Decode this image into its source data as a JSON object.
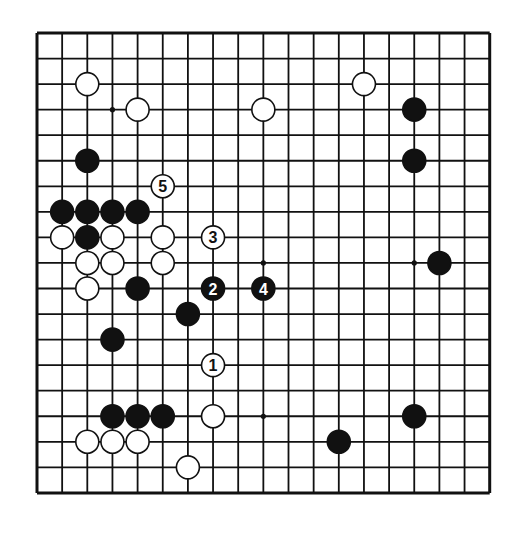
{
  "board": {
    "size": 19,
    "origin_x": 37,
    "origin_y": 33,
    "spacing_x": 25.15,
    "spacing_y": 25.55,
    "stone_radius": 11.5,
    "colors": {
      "background": "#ffffff",
      "line": "#111111",
      "black_stone": "#111111",
      "white_stone": "#ffffff",
      "stone_outline": "#111111"
    },
    "star_points": [
      [
        3,
        3
      ],
      [
        9,
        9
      ],
      [
        15,
        9
      ],
      [
        9,
        15
      ]
    ],
    "stones": [
      {
        "color": "white",
        "col": 2,
        "row": 2
      },
      {
        "color": "white",
        "col": 4,
        "row": 3
      },
      {
        "color": "white",
        "col": 9,
        "row": 3
      },
      {
        "color": "white",
        "col": 13,
        "row": 2
      },
      {
        "color": "black",
        "col": 15,
        "row": 3
      },
      {
        "color": "black",
        "col": 2,
        "row": 5
      },
      {
        "color": "black",
        "col": 15,
        "row": 5
      },
      {
        "color": "black",
        "col": 1,
        "row": 7
      },
      {
        "color": "black",
        "col": 2,
        "row": 7
      },
      {
        "color": "black",
        "col": 3,
        "row": 7
      },
      {
        "color": "black",
        "col": 4,
        "row": 7
      },
      {
        "color": "white",
        "col": 1,
        "row": 8
      },
      {
        "color": "black",
        "col": 2,
        "row": 8
      },
      {
        "color": "white",
        "col": 3,
        "row": 8
      },
      {
        "color": "white",
        "col": 5,
        "row": 8
      },
      {
        "color": "white",
        "col": 2,
        "row": 9
      },
      {
        "color": "white",
        "col": 3,
        "row": 9
      },
      {
        "color": "white",
        "col": 5,
        "row": 9
      },
      {
        "color": "black",
        "col": 16,
        "row": 9
      },
      {
        "color": "white",
        "col": 2,
        "row": 10
      },
      {
        "color": "black",
        "col": 4,
        "row": 10
      },
      {
        "color": "black",
        "col": 6,
        "row": 11
      },
      {
        "color": "black",
        "col": 3,
        "row": 12
      },
      {
        "color": "black",
        "col": 3,
        "row": 15
      },
      {
        "color": "black",
        "col": 4,
        "row": 15
      },
      {
        "color": "black",
        "col": 5,
        "row": 15
      },
      {
        "color": "white",
        "col": 7,
        "row": 15
      },
      {
        "color": "black",
        "col": 15,
        "row": 15
      },
      {
        "color": "white",
        "col": 2,
        "row": 16
      },
      {
        "color": "white",
        "col": 3,
        "row": 16
      },
      {
        "color": "white",
        "col": 4,
        "row": 16
      },
      {
        "color": "black",
        "col": 12,
        "row": 16
      },
      {
        "color": "white",
        "col": 6,
        "row": 17
      }
    ],
    "numbered_moves": [
      {
        "number": "1",
        "color": "white",
        "col": 7,
        "row": 13
      },
      {
        "number": "2",
        "color": "black",
        "col": 7,
        "row": 10
      },
      {
        "number": "3",
        "color": "white",
        "col": 7,
        "row": 8
      },
      {
        "number": "4",
        "color": "black",
        "col": 9,
        "row": 10
      },
      {
        "number": "5",
        "color": "white",
        "col": 5,
        "row": 6
      }
    ]
  }
}
